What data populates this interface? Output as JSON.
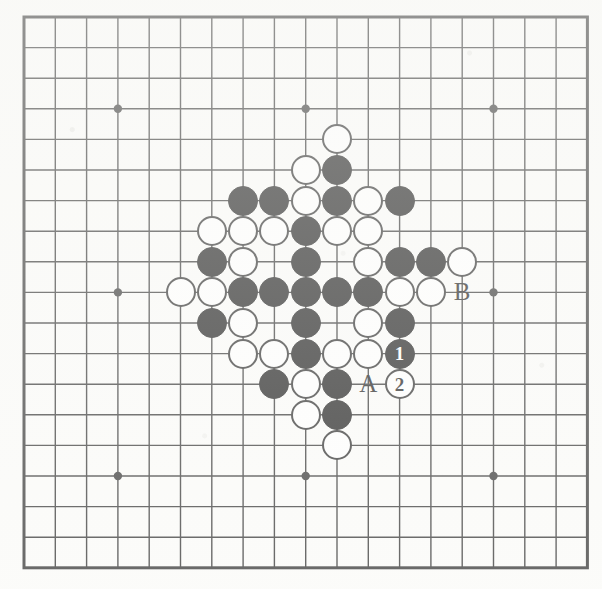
{
  "figure": {
    "kind": "go-board-diagram",
    "board_size": 19,
    "background_color": "#fbfbf9",
    "line_color": "#1a1a1a",
    "black_color": "#000000",
    "white_color": "#ffffff",
    "geometry": {
      "left": 24,
      "top": 17,
      "step_x": 31.3,
      "step_y": 30.6,
      "stone_diameter": 30,
      "border_width": 3,
      "line_width": 1.4,
      "star_radius": 4.2
    },
    "star_points": [
      {
        "col": 3,
        "row": 3
      },
      {
        "col": 9,
        "row": 3
      },
      {
        "col": 15,
        "row": 3
      },
      {
        "col": 3,
        "row": 9
      },
      {
        "col": 9,
        "row": 9
      },
      {
        "col": 15,
        "row": 9
      },
      {
        "col": 3,
        "row": 15
      },
      {
        "col": 9,
        "row": 15
      },
      {
        "col": 15,
        "row": 15
      }
    ]
  },
  "stones": [
    {
      "col": 10,
      "row": 4,
      "color": "white"
    },
    {
      "col": 9,
      "row": 5,
      "color": "white"
    },
    {
      "col": 10,
      "row": 5,
      "color": "black"
    },
    {
      "col": 7,
      "row": 6,
      "color": "black"
    },
    {
      "col": 8,
      "row": 6,
      "color": "black"
    },
    {
      "col": 9,
      "row": 6,
      "color": "white"
    },
    {
      "col": 10,
      "row": 6,
      "color": "black"
    },
    {
      "col": 11,
      "row": 6,
      "color": "white"
    },
    {
      "col": 12,
      "row": 6,
      "color": "black"
    },
    {
      "col": 6,
      "row": 7,
      "color": "white"
    },
    {
      "col": 7,
      "row": 7,
      "color": "white"
    },
    {
      "col": 8,
      "row": 7,
      "color": "white"
    },
    {
      "col": 9,
      "row": 7,
      "color": "black"
    },
    {
      "col": 10,
      "row": 7,
      "color": "white"
    },
    {
      "col": 11,
      "row": 7,
      "color": "white"
    },
    {
      "col": 6,
      "row": 8,
      "color": "black"
    },
    {
      "col": 7,
      "row": 8,
      "color": "white"
    },
    {
      "col": 9,
      "row": 8,
      "color": "black"
    },
    {
      "col": 11,
      "row": 8,
      "color": "white"
    },
    {
      "col": 12,
      "row": 8,
      "color": "black"
    },
    {
      "col": 13,
      "row": 8,
      "color": "black"
    },
    {
      "col": 14,
      "row": 8,
      "color": "white"
    },
    {
      "col": 5,
      "row": 9,
      "color": "white"
    },
    {
      "col": 6,
      "row": 9,
      "color": "white"
    },
    {
      "col": 7,
      "row": 9,
      "color": "black"
    },
    {
      "col": 8,
      "row": 9,
      "color": "black"
    },
    {
      "col": 9,
      "row": 9,
      "color": "black"
    },
    {
      "col": 10,
      "row": 9,
      "color": "black"
    },
    {
      "col": 11,
      "row": 9,
      "color": "black"
    },
    {
      "col": 12,
      "row": 9,
      "color": "white"
    },
    {
      "col": 13,
      "row": 9,
      "color": "white"
    },
    {
      "col": 6,
      "row": 10,
      "color": "black"
    },
    {
      "col": 7,
      "row": 10,
      "color": "white"
    },
    {
      "col": 9,
      "row": 10,
      "color": "black"
    },
    {
      "col": 11,
      "row": 10,
      "color": "white"
    },
    {
      "col": 12,
      "row": 10,
      "color": "black"
    },
    {
      "col": 7,
      "row": 11,
      "color": "white"
    },
    {
      "col": 8,
      "row": 11,
      "color": "white"
    },
    {
      "col": 9,
      "row": 11,
      "color": "black"
    },
    {
      "col": 10,
      "row": 11,
      "color": "white"
    },
    {
      "col": 11,
      "row": 11,
      "color": "white"
    },
    {
      "col": 12,
      "row": 11,
      "color": "black",
      "number": "1"
    },
    {
      "col": 8,
      "row": 12,
      "color": "black"
    },
    {
      "col": 9,
      "row": 12,
      "color": "white"
    },
    {
      "col": 10,
      "row": 12,
      "color": "black"
    },
    {
      "col": 12,
      "row": 12,
      "color": "white",
      "number": "2"
    },
    {
      "col": 9,
      "row": 13,
      "color": "white"
    },
    {
      "col": 10,
      "row": 13,
      "color": "black"
    },
    {
      "col": 10,
      "row": 14,
      "color": "white"
    }
  ],
  "point_labels": [
    {
      "text": "A",
      "col": 11,
      "row": 12
    },
    {
      "text": "B",
      "col": 14,
      "row": 9
    }
  ]
}
